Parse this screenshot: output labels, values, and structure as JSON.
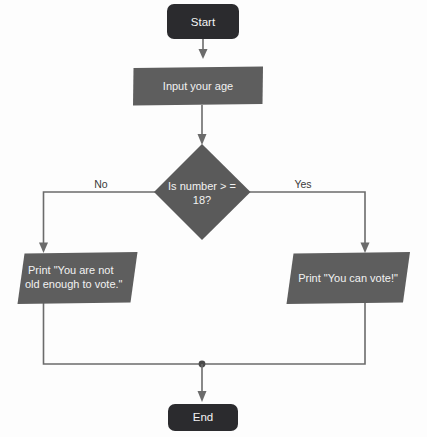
{
  "diagram": {
    "type": "flowchart",
    "colors": {
      "terminal_fill": "#2b2b2e",
      "process_fill": "#5e5e5e",
      "decision_fill": "#5a5a5a",
      "io_fill": "#5e5e5e",
      "connector": "#6b6b6b",
      "background": "#fdfdfd",
      "node_text": "#f2f2f2",
      "branch_text": "#3a3a3a"
    },
    "nodes": {
      "start": {
        "label": "Start",
        "shape": "terminal-rounded"
      },
      "input": {
        "label": "Input your age",
        "shape": "rectangle"
      },
      "decision": {
        "label_line1": "Is number > =",
        "label_line2": "18?",
        "shape": "diamond"
      },
      "print_no": {
        "label_line1": "Print \"You are not",
        "label_line2": "old enough to vote.\"",
        "shape": "parallelogram"
      },
      "print_yes": {
        "label": "Print \"You can vote!\"",
        "shape": "parallelogram"
      },
      "end": {
        "label": "End",
        "shape": "terminal-rounded"
      }
    },
    "branches": {
      "no_label": "No",
      "yes_label": "Yes"
    }
  }
}
